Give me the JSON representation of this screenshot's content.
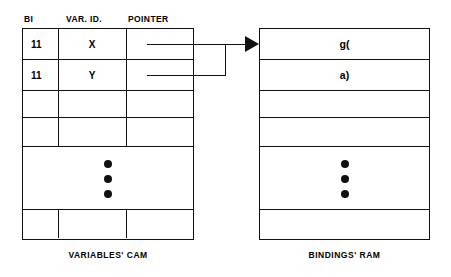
{
  "cam": {
    "caption": "VARIABLES' CAM",
    "headers": {
      "bi": "BI",
      "var_id": "VAR. ID.",
      "pointer": "POINTER"
    },
    "rows": [
      {
        "bi": "11",
        "var_id": "X",
        "pointer": ""
      },
      {
        "bi": "11",
        "var_id": "Y",
        "pointer": ""
      },
      {
        "bi": "",
        "var_id": "",
        "pointer": ""
      },
      {
        "bi": "",
        "var_id": "",
        "pointer": ""
      }
    ],
    "ellipsis_dots": 3,
    "footer_row": {
      "bi": "",
      "var_id": "",
      "pointer": ""
    }
  },
  "ram": {
    "caption": "BINDINGS' RAM",
    "rows": [
      {
        "value": "g("
      },
      {
        "value": "a)"
      },
      {
        "value": ""
      },
      {
        "value": ""
      }
    ],
    "ellipsis_dots": 3,
    "footer_row": {
      "value": ""
    }
  },
  "colors": {
    "line": "#111111",
    "background": "#ffffff",
    "text": "#000000"
  }
}
